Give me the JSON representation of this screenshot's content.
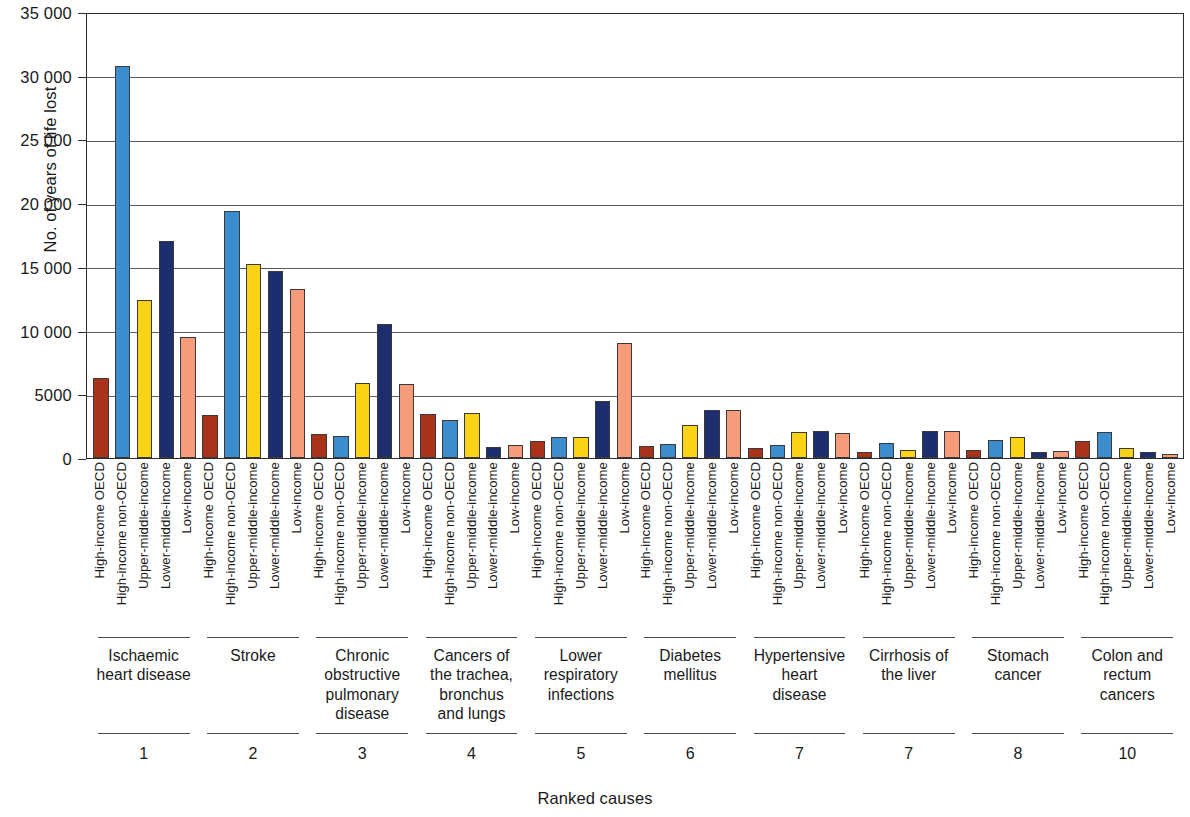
{
  "chart_data": {
    "type": "bar",
    "title": "",
    "xlabel": "Ranked causes",
    "ylabel": "No. of years of life lost",
    "ylim": [
      0,
      35000
    ],
    "ytick_labels": [
      "0",
      "5000",
      "10 000",
      "15 000",
      "20 000",
      "25 000",
      "30 000",
      "35 000"
    ],
    "ytick_values": [
      0,
      5000,
      10000,
      15000,
      20000,
      25000,
      30000,
      35000
    ],
    "grid": "horizontal",
    "legend": "none",
    "categories": [
      "High-income OECD",
      "High-income non-OECD",
      "Upper-middle-income",
      "Lower-middle-income",
      "Low-income"
    ],
    "category_colors": [
      "#A8321A",
      "#3C8DCE",
      "#FBD316",
      "#1C2E6E",
      "#F59C7D"
    ],
    "groups": [
      {
        "name": "Ischaemic\nheart disease",
        "rank": "1",
        "values": [
          6300,
          30800,
          12400,
          17000,
          9500
        ]
      },
      {
        "name": "Stroke",
        "rank": "2",
        "values": [
          3400,
          19400,
          15200,
          14700,
          13300
        ]
      },
      {
        "name": "Chronic\nobstructive\npulmonary\ndisease",
        "rank": "3",
        "values": [
          1850,
          1700,
          5900,
          10500,
          5800
        ]
      },
      {
        "name": "Cancers of\nthe trachea,\nbronchus\nand lungs",
        "rank": "4",
        "values": [
          3450,
          2950,
          3550,
          900,
          1000
        ]
      },
      {
        "name": "Lower\nrespiratory\ninfections",
        "rank": "5",
        "values": [
          1300,
          1650,
          1650,
          4500,
          9000
        ]
      },
      {
        "name": "Diabetes\nmellitus",
        "rank": "6",
        "values": [
          950,
          1100,
          2600,
          3750,
          3750
        ]
      },
      {
        "name": "Hypertensive\nheart\ndisease",
        "rank": "7",
        "values": [
          750,
          1050,
          2050,
          2100,
          1950
        ]
      },
      {
        "name": "Cirrhosis of\nthe liver",
        "rank": "7",
        "values": [
          500,
          1200,
          650,
          2150,
          2150
        ]
      },
      {
        "name": "Stomach\ncancer",
        "rank": "8",
        "values": [
          600,
          1450,
          1650,
          450,
          550
        ]
      },
      {
        "name": "Colon and\nrectum\ncancers",
        "rank": "10",
        "values": [
          1300,
          2050,
          750,
          500,
          350
        ]
      }
    ]
  }
}
